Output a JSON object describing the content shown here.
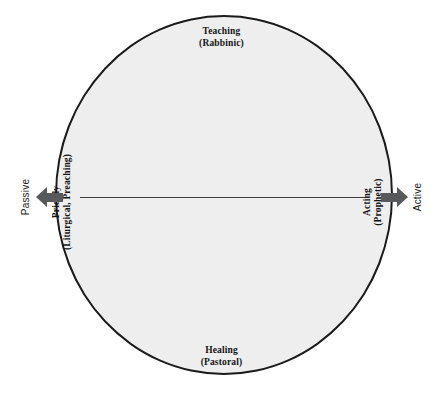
{
  "diagram": {
    "shape": "circle",
    "fill_color": "#eeeeee",
    "stroke_color": "#1b1b1b",
    "axis_line_color": "#3a3a3a",
    "arrow_color": "#58595b",
    "poles": {
      "top": {
        "term": "Teaching",
        "qualifier": "(Rabbinic)"
      },
      "bottom": {
        "term": "Healing",
        "qualifier": "(Pastoral)"
      },
      "left": {
        "term": "Priestly",
        "qualifier": "(Liturgical, Preaching)"
      },
      "right": {
        "term": "Acting",
        "qualifier": "(Prophetic)"
      }
    },
    "axis": {
      "left_end_label": "Passive",
      "right_end_label": "Active"
    }
  }
}
